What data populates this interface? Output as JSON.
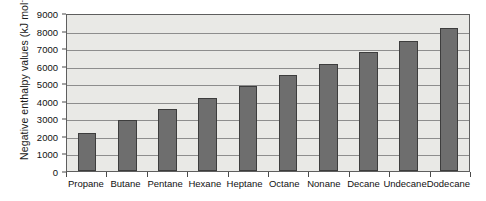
{
  "chart_data": {
    "type": "bar",
    "title": "",
    "xlabel": "",
    "ylabel": "Negative enthalpy values (kJ mol",
    "ylabel_superscript": "-1",
    "ylabel_suffix": ")",
    "categories": [
      "Propane",
      "Butane",
      "Pentane",
      "Hexane",
      "Heptane",
      "Octane",
      "Nonane",
      "Decane",
      "Undecane",
      "Dodecane"
    ],
    "values": [
      2160,
      2880,
      3510,
      4160,
      4820,
      5470,
      6120,
      6780,
      7430,
      8130
    ],
    "ylim": [
      0,
      9000
    ],
    "yticks": [
      0,
      1000,
      2000,
      3000,
      4000,
      5000,
      6000,
      7000,
      8000,
      9000
    ],
    "ytick_labels": [
      "0",
      "1000",
      "2000",
      "3000",
      "4000",
      "5000",
      "6000",
      "7000",
      "8000",
      "9000"
    ],
    "grid": true,
    "legend": false,
    "colors": {
      "bar_fill": "#6e6e6e",
      "bar_stroke": "#3d3d3d",
      "plot_background": "#e9e9e6",
      "gridline": "#8d8d8d",
      "axis": "#5e5e5e",
      "text": "#111111",
      "page_background": "#ffffff"
    }
  }
}
